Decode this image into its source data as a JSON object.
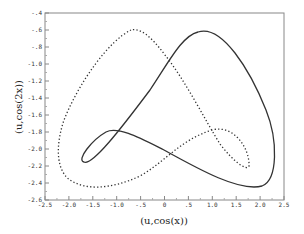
{
  "chart_data": {
    "type": "line",
    "title": "",
    "xlabel": "(u,cos(x))",
    "ylabel": "(u,cos(2x))",
    "xlim": [
      -2.5,
      2.5
    ],
    "ylim": [
      -2.6,
      -0.4
    ],
    "grid": false,
    "legend": null,
    "x_ticks": [
      "-2.5",
      "-2.0",
      "-1.5",
      "-1.0",
      "-.5",
      "0",
      ".5",
      "1.0",
      "1.5",
      "2.0",
      "2.5"
    ],
    "y_ticks": [
      "-.4",
      "-.6",
      "-.8",
      "-1.0",
      "-1.2",
      "-1.4",
      "-1.6",
      "-1.8",
      "-2.0",
      "-2.2",
      "-2.4",
      "-2.6"
    ],
    "series": [
      {
        "name": "solid",
        "style": "solid",
        "color": "#333333",
        "points": [
          [
            0.7,
            -0.62
          ],
          [
            1.4,
            -1.0
          ],
          [
            2.0,
            -1.6
          ],
          [
            2.3,
            -2.1
          ],
          [
            2.1,
            -2.4
          ],
          [
            1.8,
            -2.43
          ],
          [
            1.0,
            -2.3
          ],
          [
            0.0,
            -1.95
          ],
          [
            -1.0,
            -1.77
          ],
          [
            -1.5,
            -1.85
          ],
          [
            -1.75,
            -2.1
          ],
          [
            -1.6,
            -2.17
          ],
          [
            -1.2,
            -1.95
          ],
          [
            -0.6,
            -1.4
          ],
          [
            0.0,
            -0.9
          ],
          [
            0.7,
            -0.62
          ]
        ]
      },
      {
        "name": "dotted",
        "style": "dotted",
        "color": "#333333",
        "points": [
          [
            -0.7,
            -0.6
          ],
          [
            -1.5,
            -1.1
          ],
          [
            -2.1,
            -1.8
          ],
          [
            -2.2,
            -2.2
          ],
          [
            -1.9,
            -2.4
          ],
          [
            -1.3,
            -2.45
          ],
          [
            -0.5,
            -2.3
          ],
          [
            0.0,
            -1.98
          ],
          [
            1.0,
            -1.78
          ],
          [
            1.6,
            -1.9
          ],
          [
            1.75,
            -2.2
          ],
          [
            1.5,
            -2.15
          ],
          [
            1.0,
            -1.9
          ],
          [
            0.4,
            -1.3
          ],
          [
            0.0,
            -0.95
          ],
          [
            -0.7,
            -0.6
          ]
        ]
      }
    ]
  }
}
